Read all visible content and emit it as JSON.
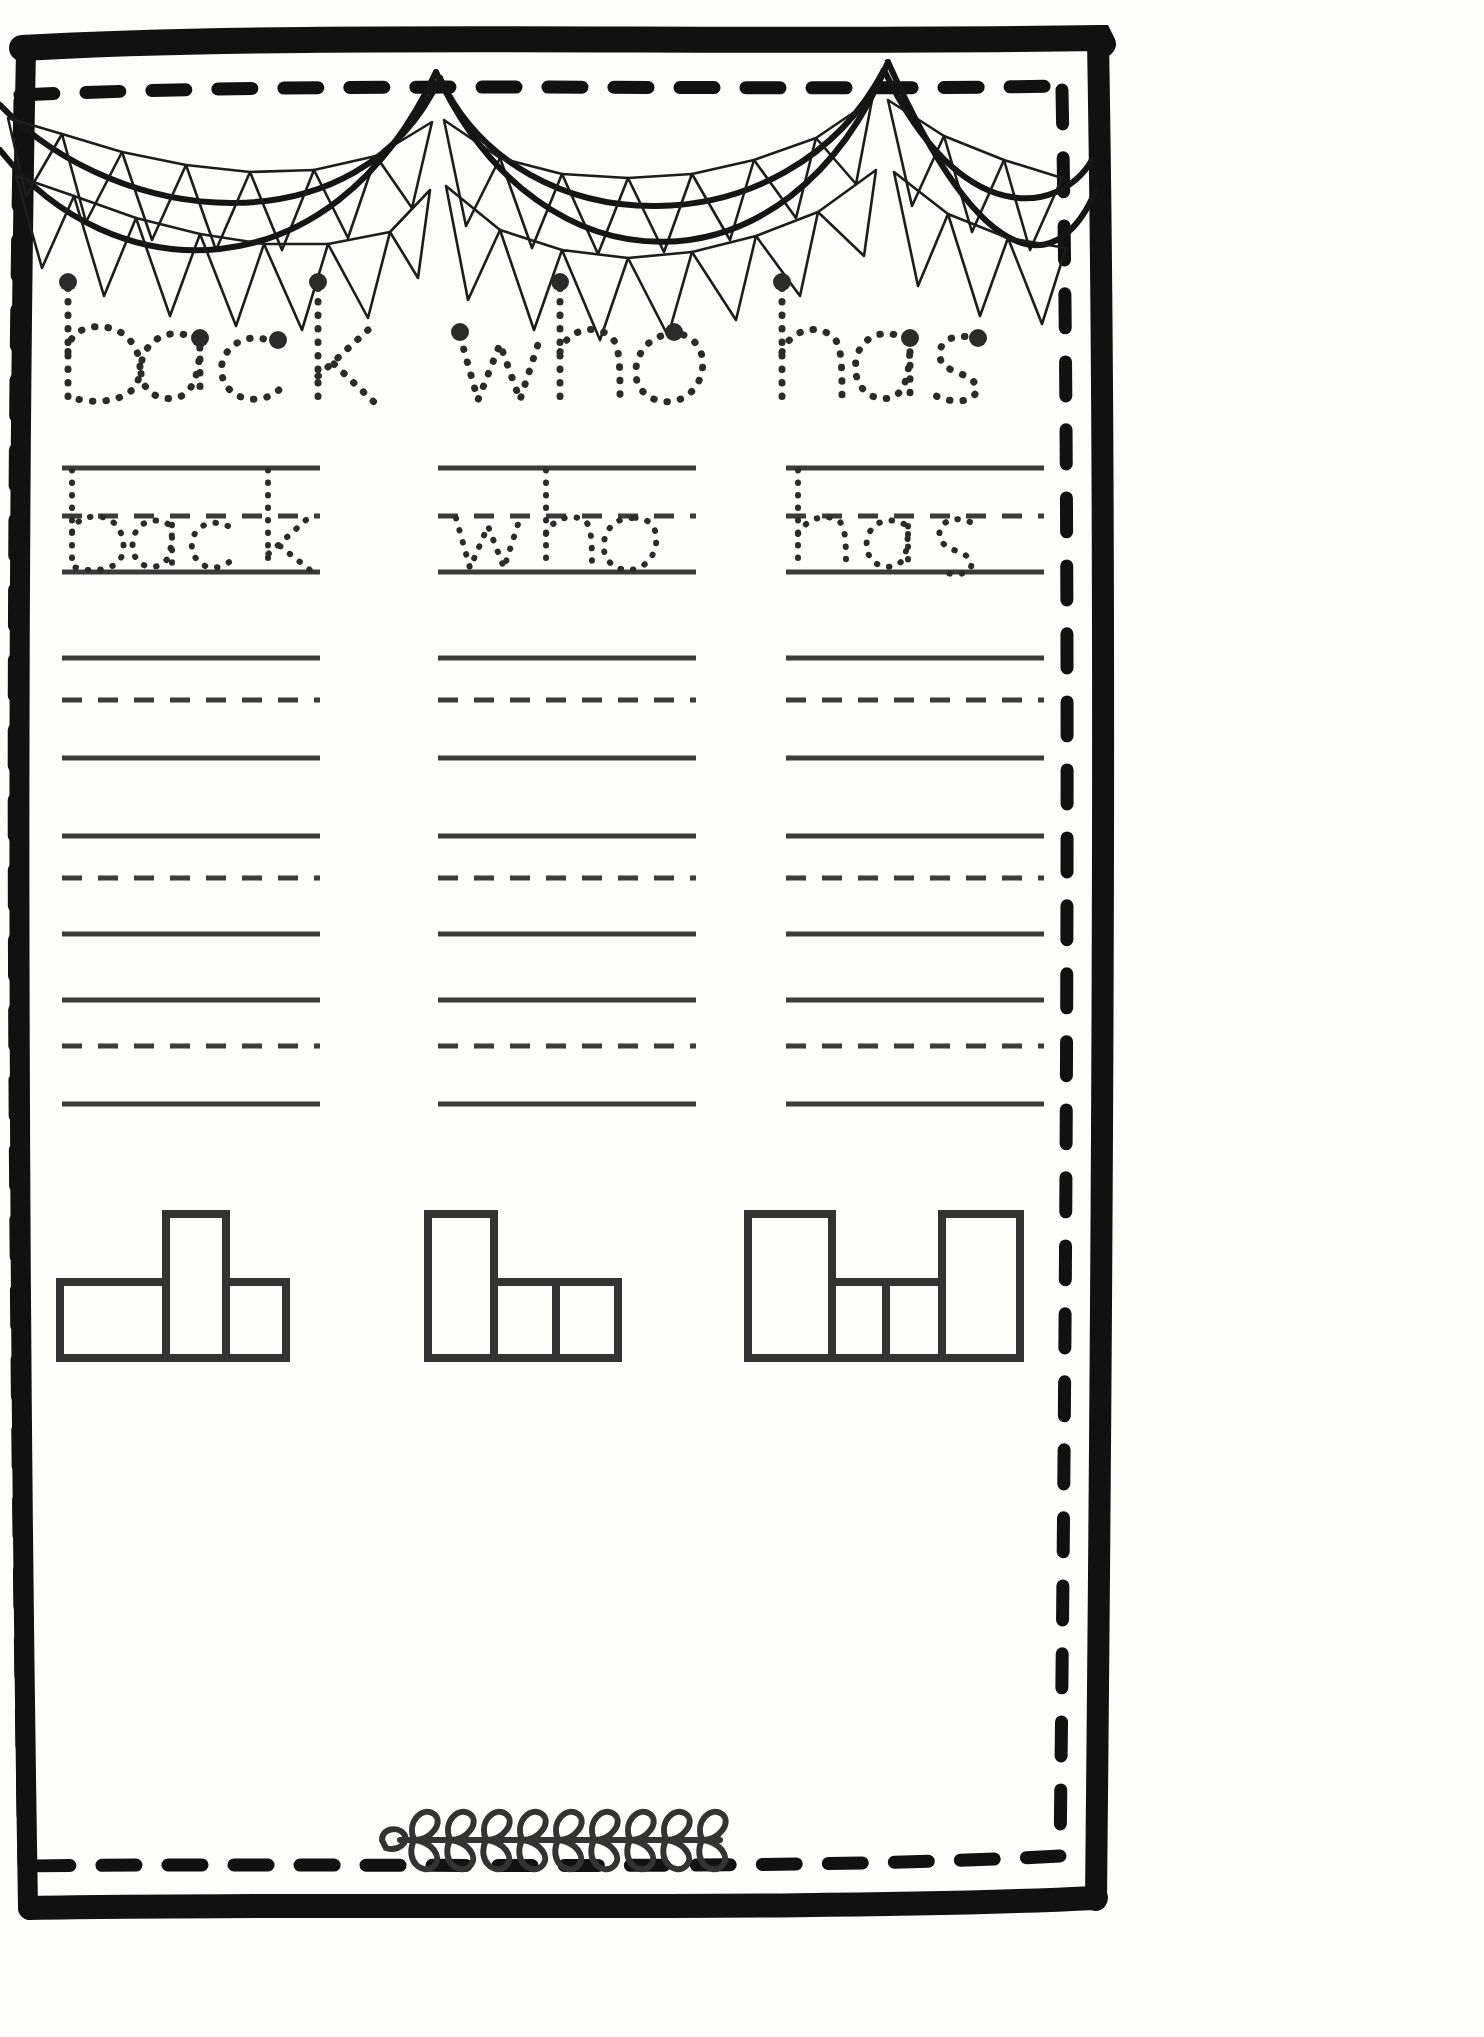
{
  "worksheet": {
    "type": "handwriting-practice-worksheet",
    "title_words": [
      "back",
      "who",
      "has"
    ],
    "trace_words": [
      "back",
      "who",
      "has"
    ],
    "columns": 3,
    "decorations": {
      "top": "bunting-banner",
      "bottom": "leafy-vine-branch",
      "border": "hand-drawn-double-frame"
    },
    "colors": {
      "ink": "#1a1a1a",
      "line": "#3b3b3b",
      "paper": "#fdfdfc",
      "dotted": "#2b2b2b"
    },
    "title_row": {
      "label": "dotted-trace-title",
      "words": [
        {
          "text": "back",
          "x": 62,
          "width": 330
        },
        {
          "text": "who",
          "x": 452,
          "width": 250
        },
        {
          "text": "has",
          "x": 762,
          "width": 230
        }
      ]
    },
    "practice": {
      "column_x": [
        62,
        438,
        786
      ],
      "column_width": 258,
      "traced_row": {
        "top_line_y": 468,
        "mid_line_y": 516,
        "base_line_y": 572,
        "words": [
          "back",
          "who",
          "has"
        ]
      },
      "blank_rows": [
        {
          "top_line_y": 658,
          "mid_line_y": 700,
          "base_line_y": 758
        },
        {
          "top_line_y": 836,
          "mid_line_y": 878,
          "base_line_y": 934
        },
        {
          "top_line_y": 1000,
          "mid_line_y": 1046,
          "base_line_y": 1104
        }
      ],
      "line_style": {
        "solid": "solid",
        "middle": "dashed"
      }
    },
    "word_shape_boxes": {
      "label": "word-shape-box-puzzle",
      "groups": [
        {
          "word": "back",
          "x": 60,
          "cells": [
            {
              "letter": "b",
              "tall": true,
              "w": 78,
              "order": 1
            },
            {
              "letter": "a",
              "tall": false,
              "w": 86,
              "order": 2
            },
            {
              "letter": "c",
              "tall": false,
              "w": 86,
              "order": 3
            },
            {
              "letter": "k",
              "tall": true,
              "w": 62,
              "order": 4
            }
          ]
        },
        {
          "word": "who",
          "x": 428,
          "cells": [
            {
              "letter": "w",
              "tall": true,
              "w": 62,
              "order": 1
            },
            {
              "letter": "h",
              "tall": true,
              "w": 62,
              "order": 2
            },
            {
              "letter": "o",
              "tall": false,
              "w": 60,
              "order": 3
            }
          ]
        },
        {
          "word": "has",
          "x": 748,
          "cells": [
            {
              "letter": "h",
              "tall": true,
              "w": 84,
              "order": 1
            },
            {
              "letter": "a",
              "tall": false,
              "w": 84,
              "order": 2
            },
            {
              "letter": "s",
              "tall": false,
              "w": 84,
              "order": 3
            }
          ]
        }
      ]
    },
    "vine": {
      "x": 378,
      "y": 1840,
      "length": 340,
      "leaf_count": 10
    }
  }
}
